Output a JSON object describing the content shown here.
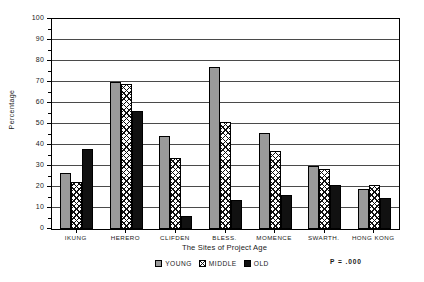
{
  "chart_data": {
    "type": "bar",
    "title": "",
    "xlabel": "The Sites of Project Age",
    "ylabel": "Percentage",
    "ylim": [
      0,
      100
    ],
    "ytick_step": 10,
    "yticks": [
      0,
      10,
      20,
      30,
      40,
      50,
      60,
      70,
      80,
      90,
      100
    ],
    "grid": true,
    "legend_position": "bottom-center",
    "annotation": "P  =  .000",
    "categories": [
      "IKUNG",
      "HERERO",
      "CLIFDEN",
      "BLESS.",
      "MOMENCE",
      "SWARTH.",
      "HONG KONG"
    ],
    "series": [
      {
        "name": "YOUNG",
        "color": "#9a9a9a",
        "pattern": "solid-gray",
        "values": [
          26.5,
          70.0,
          44.5,
          77.0,
          45.5,
          30.0,
          19.0
        ]
      },
      {
        "name": "MIDDLE",
        "color": "#ffffff",
        "pattern": "crosshatch",
        "values": [
          22.5,
          69.0,
          34.0,
          51.0,
          37.0,
          28.5,
          21.0
        ]
      },
      {
        "name": "OLD",
        "color": "#111111",
        "pattern": "solid-black",
        "values": [
          38.0,
          56.0,
          6.0,
          14.0,
          16.0,
          21.0,
          15.0
        ]
      }
    ]
  }
}
